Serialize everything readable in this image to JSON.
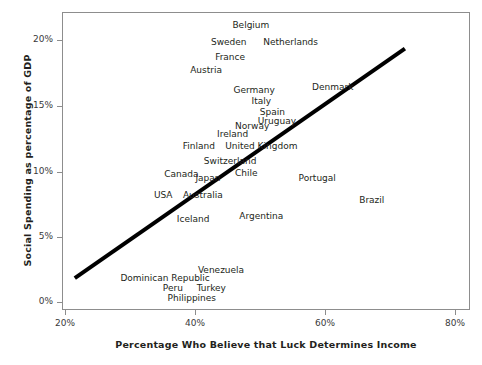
{
  "chart_data": {
    "type": "scatter",
    "title": "",
    "xlabel": "Percentage Who Believe that Luck Determines Income",
    "ylabel": "Social Spending as percentage of GDP",
    "xlim": [
      20,
      80
    ],
    "ylim": [
      0,
      21.7
    ],
    "grid": false,
    "legend": null,
    "x_ticks": [
      "20%",
      "40%",
      "60%",
      "80%"
    ],
    "x_tick_values": [
      20,
      40,
      60,
      80
    ],
    "y_ticks": [
      "0%",
      "5%",
      "10%",
      "15%",
      "20%"
    ],
    "y_tick_values": [
      0,
      5,
      10,
      15,
      20
    ],
    "point_style": "text-label-only",
    "points": [
      {
        "label": "Belgium",
        "x": 48.6,
        "y": 21.0
      },
      {
        "label": "Sweden",
        "x": 45.2,
        "y": 19.7
      },
      {
        "label": "Netherlands",
        "x": 54.7,
        "y": 19.7
      },
      {
        "label": "France",
        "x": 45.4,
        "y": 18.6
      },
      {
        "label": "Austria",
        "x": 41.7,
        "y": 17.6
      },
      {
        "label": "Germany",
        "x": 49.1,
        "y": 16.1
      },
      {
        "label": "Denmark",
        "x": 61.2,
        "y": 16.3
      },
      {
        "label": "Italy",
        "x": 50.2,
        "y": 15.2
      },
      {
        "label": "Spain",
        "x": 51.9,
        "y": 14.4
      },
      {
        "label": "Uruguay",
        "x": 52.6,
        "y": 13.7
      },
      {
        "label": "Norway",
        "x": 48.8,
        "y": 13.3
      },
      {
        "label": "Ireland",
        "x": 45.8,
        "y": 12.7
      },
      {
        "label": "Finland",
        "x": 40.6,
        "y": 11.8
      },
      {
        "label": "United Kingdom",
        "x": 50.2,
        "y": 11.8
      },
      {
        "label": "Switzerland",
        "x": 45.4,
        "y": 10.7
      },
      {
        "label": "Canada",
        "x": 37.9,
        "y": 9.7
      },
      {
        "label": "Chile",
        "x": 47.9,
        "y": 9.8
      },
      {
        "label": "Japan",
        "x": 42.0,
        "y": 9.4
      },
      {
        "label": "Portugal",
        "x": 58.8,
        "y": 9.4
      },
      {
        "label": "USA",
        "x": 35.1,
        "y": 8.1
      },
      {
        "label": "Australia",
        "x": 41.2,
        "y": 8.1
      },
      {
        "label": "Brazil",
        "x": 67.2,
        "y": 7.7
      },
      {
        "label": "Iceland",
        "x": 39.7,
        "y": 6.3
      },
      {
        "label": "Argentina",
        "x": 50.2,
        "y": 6.5
      },
      {
        "label": "Venezuela",
        "x": 44.0,
        "y": 2.4
      },
      {
        "label": "Dominican Republic",
        "x": 35.4,
        "y": 1.8
      },
      {
        "label": "Peru",
        "x": 36.6,
        "y": 1.1
      },
      {
        "label": "Turkey",
        "x": 42.5,
        "y": 1.1
      },
      {
        "label": "Philippines",
        "x": 39.5,
        "y": 0.3
      }
    ],
    "trendline": {
      "type": "linear-fit",
      "x_start": 21.5,
      "y_start": 1.8,
      "x_end": 72.3,
      "y_end": 19.2,
      "color": "#000000",
      "width_px": 4
    }
  }
}
